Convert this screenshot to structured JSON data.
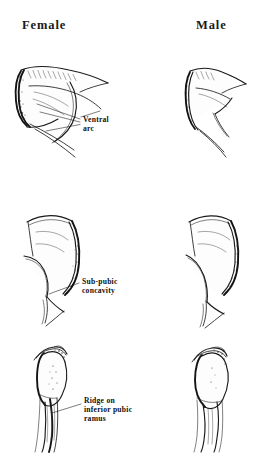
{
  "figure": {
    "background_color": "#ffffff",
    "ink_color": "#1a1a1a"
  },
  "columns": [
    {
      "id": "female",
      "label": "Female"
    },
    {
      "id": "male",
      "label": "Male"
    }
  ],
  "rows": [
    {
      "id": "row-ventral-arc",
      "trait": "Ventral arc",
      "callout": {
        "line1": "Ventral",
        "line2": "arc"
      }
    },
    {
      "id": "row-subpubic-concavity",
      "trait": "Sub-pubic concavity",
      "callout": {
        "line1": "Sub-pubic",
        "line2": "concavity"
      }
    },
    {
      "id": "row-inferior-pubic-ramus",
      "trait": "Ridge on inferior pubic ramus",
      "callout": {
        "line1": "Ridge on",
        "line2": "inferior pubic",
        "line3": "ramus"
      }
    }
  ],
  "specimens": [
    {
      "id": "female-ventral-arc",
      "column": "female",
      "row": "row-ventral-arc"
    },
    {
      "id": "male-ventral-arc",
      "column": "male",
      "row": "row-ventral-arc"
    },
    {
      "id": "female-subpubic-concavity",
      "column": "female",
      "row": "row-subpubic-concavity"
    },
    {
      "id": "male-subpubic-concavity",
      "column": "male",
      "row": "row-subpubic-concavity"
    },
    {
      "id": "female-inferior-ramus",
      "column": "female",
      "row": "row-inferior-pubic-ramus"
    },
    {
      "id": "male-inferior-ramus",
      "column": "male",
      "row": "row-inferior-pubic-ramus"
    }
  ]
}
